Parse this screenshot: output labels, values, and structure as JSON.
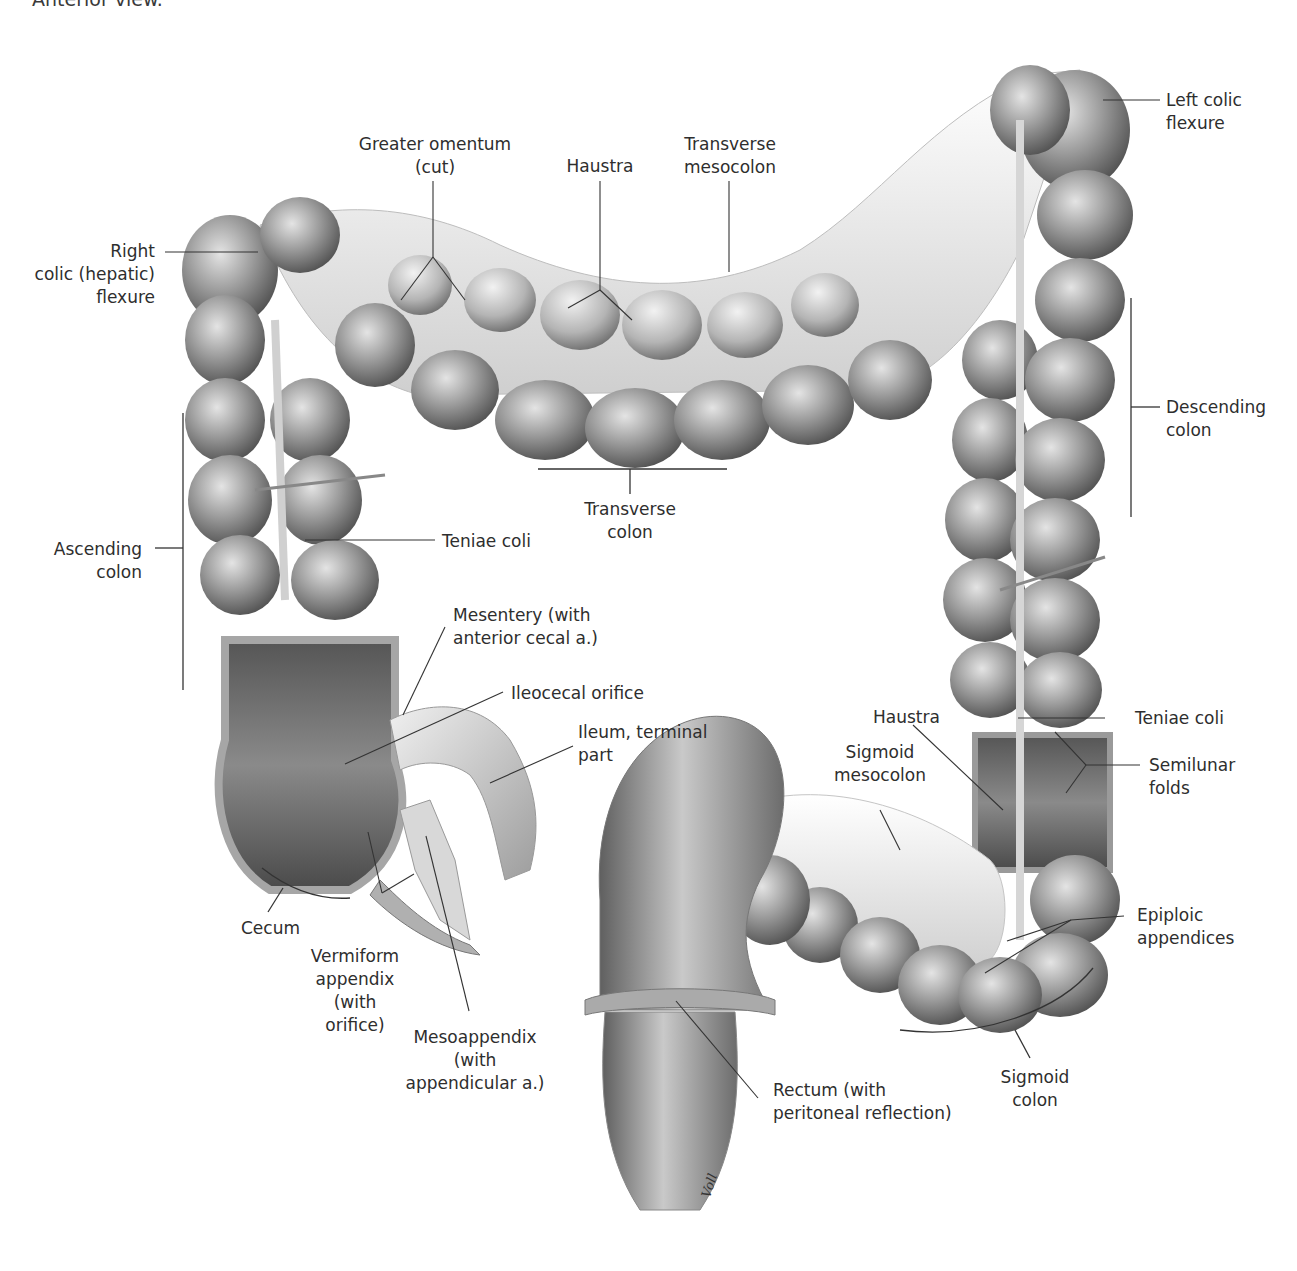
{
  "caption": "Anterior view.",
  "figure": {
    "colors": {
      "background": "#ffffff",
      "tissue_dark": "#5a5a5a",
      "tissue_mid": "#8c8c8c",
      "tissue_light": "#d4d4d4",
      "mesentery": "#e9e9e9",
      "leader_line": "#333333",
      "text": "#2e2e2e"
    },
    "signature": "Voll"
  },
  "labels": {
    "greater_omentum": "Greater omentum\n(cut)",
    "haustra_top": "Haustra",
    "transverse_mesocolon": "Transverse\nmesocolon",
    "left_colic_flexure": "Left colic\nflexure",
    "right_colic_flexure": "Right\ncolic (hepatic)\nflexure",
    "descending_colon": "Descending\ncolon",
    "transverse_colon": "Transverse\ncolon",
    "ascending_colon": "Ascending\ncolon",
    "teniae_coli_left": "Teniae coli",
    "mesentery": "Mesentery (with\nanterior cecal a.)",
    "ileocecal_orifice": "Ileocecal orifice",
    "ileum_terminal": "Ileum, terminal\npart",
    "haustra_right": "Haustra",
    "teniae_coli_right": "Teniae coli",
    "sigmoid_mesocolon": "Sigmoid\nmesocolon",
    "semilunar_folds": "Semilunar\nfolds",
    "epiploic_appendices": "Epiploic\nappendices",
    "cecum": "Cecum",
    "vermiform_appendix": "Vermiform\nappendix\n(with\norifice)",
    "mesoappendix": "Mesoappendix\n(with\nappendicular a.)",
    "rectum": "Rectum (with\nperitoneal reflection)",
    "sigmoid_colon": "Sigmoid\ncolon"
  }
}
